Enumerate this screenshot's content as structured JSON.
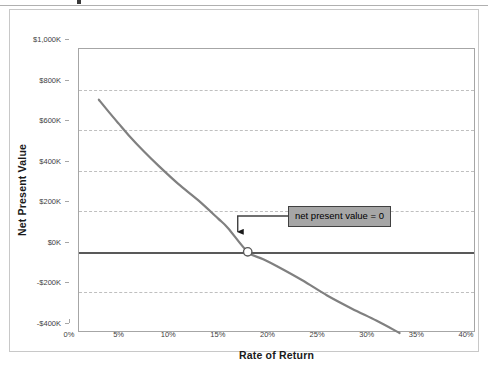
{
  "chart_data": {
    "type": "line",
    "title": "",
    "xlabel": "Rate of Return",
    "ylabel": "Net Present Value",
    "xlim": [
      0,
      40
    ],
    "ylim": [
      -400,
      1000
    ],
    "grid": "horizontal-dashed",
    "legend": "none",
    "x_tick_labels": [
      "0%",
      "5%",
      "10%",
      "15%",
      "20%",
      "25%",
      "30%",
      "35%",
      "40%"
    ],
    "x_tick_values": [
      0,
      5,
      10,
      15,
      20,
      25,
      30,
      35,
      40
    ],
    "y_tick_labels": [
      "$1,000K",
      "$800K",
      "$600K",
      "$400K",
      "$200K",
      "$0K",
      "-$200K",
      "-$400K"
    ],
    "y_tick_values": [
      1000,
      800,
      600,
      400,
      200,
      0,
      -200,
      -400
    ],
    "series": [
      {
        "name": "Net Present Value",
        "color": "#808080",
        "x": [
          2.0,
          3.0,
          4.0,
          5.0,
          6.5,
          8.0,
          10.0,
          12.0,
          14.0,
          15.0,
          17.0,
          18.5,
          20.0,
          22.5,
          25.0,
          27.5,
          30.0,
          32.3
        ],
        "values": [
          750,
          690,
          632,
          575,
          497,
          425,
          335,
          255,
          165,
          118,
          0,
          -35,
          -72,
          -140,
          -215,
          -280,
          -340,
          -400
        ]
      }
    ],
    "markers": [
      {
        "name": "irr-point",
        "x": 17.0,
        "y": 0,
        "fill": "#ffffff",
        "stroke": "#595959"
      }
    ],
    "reference_lines": [
      {
        "name": "zero-line",
        "axis": "y",
        "value": 0,
        "color": "#595959",
        "width": 2
      }
    ],
    "annotations": [
      {
        "name": "npv-zero-callout",
        "text": "net present value = 0",
        "box_fill": "#a6a6a6",
        "box_border": "#404040",
        "text_color": "#000000",
        "points_to_x": 17.0,
        "points_to_y": 0
      }
    ]
  },
  "colors": {
    "curve": "#808080",
    "zero_line": "#595959",
    "gridline": "#bfbfbf",
    "axis": "#a6a6a6",
    "frame": "#c8c8c8",
    "tick_text": "#404040",
    "title_text": "#1a1a1a",
    "callout_fill": "#a6a6a6",
    "callout_border": "#404040",
    "background": "#ffffff"
  }
}
